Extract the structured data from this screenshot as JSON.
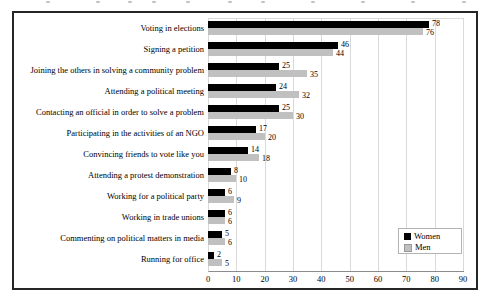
{
  "chart_data": {
    "type": "bar",
    "orientation": "horizontal",
    "title": "",
    "categories": [
      "Voting in elections",
      "Signing a petition",
      "Joining the others in solving a community problem",
      "Attending a political meeting",
      "Contacting an official in order to solve a problem",
      "Participating in the activities of an NGO",
      "Convincing friends to vote like you",
      "Attending a protest demonstration",
      "Working for a political party",
      "Working in trade unions",
      "Commenting on political matters in media",
      "Running for office"
    ],
    "series": [
      {
        "name": "Women",
        "color": "#000000",
        "values": [
          78,
          46,
          25,
          24,
          25,
          17,
          14,
          8,
          6,
          6,
          5,
          2
        ]
      },
      {
        "name": "Men",
        "color": "#c0c0c0",
        "values": [
          76,
          44,
          35,
          32,
          30,
          20,
          18,
          10,
          9,
          6,
          6,
          5
        ]
      }
    ],
    "xlim": [
      0,
      90
    ],
    "xticks": [
      0,
      10,
      20,
      30,
      40,
      50,
      60,
      70,
      80,
      90
    ],
    "grid": "vertical",
    "data_labels": true,
    "legend_position": "inside-right-bottom"
  },
  "colors": {
    "frame_border": "#262626",
    "gridline": "#d9d9d9",
    "axis_line": "#8c8c8c",
    "legend_border": "#b3b3b3"
  }
}
